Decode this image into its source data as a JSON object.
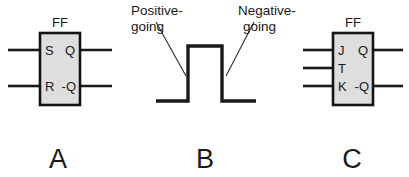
{
  "figure": {
    "background_color": "#ffffff",
    "ink_color": "#1a1a1a",
    "box_fill_color": "#dedede",
    "box_stroke_color": "#141414"
  },
  "panels": [
    {
      "letter": "A",
      "type": "sr-flip-flop-symbol",
      "block_label": "FF",
      "inputs": [
        {
          "label": "S"
        },
        {
          "label": "R"
        }
      ],
      "outputs": [
        {
          "label": "Q"
        },
        {
          "label": "-Q"
        }
      ]
    },
    {
      "letter": "B",
      "type": "pulse-waveform",
      "callouts": [
        {
          "line1": "Positive-",
          "line2": "going"
        },
        {
          "line1": "Negative-",
          "line2": "going"
        }
      ]
    },
    {
      "letter": "C",
      "type": "jk-flip-flop-symbol",
      "block_label": "FF",
      "inputs": [
        {
          "label": "J"
        },
        {
          "label": "T"
        },
        {
          "label": "K"
        }
      ],
      "outputs": [
        {
          "label": "Q"
        },
        {
          "label": "-Q"
        }
      ]
    }
  ]
}
